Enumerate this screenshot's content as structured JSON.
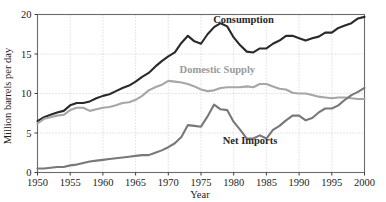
{
  "chart_data": {
    "type": "line",
    "title": "",
    "xlabel": "Year",
    "ylabel": "Million barrels per day",
    "xlim": [
      1950,
      2000
    ],
    "ylim": [
      0,
      20
    ],
    "xticks": [
      1950,
      1955,
      1960,
      1965,
      1970,
      1975,
      1980,
      1985,
      1990,
      1995,
      2000
    ],
    "xtick_labels": [
      "1950",
      "1955",
      "1960",
      "1965",
      "1970",
      "1975",
      "1980",
      "1985",
      "1990",
      "1995",
      "2000"
    ],
    "yticks": [
      0,
      5,
      10,
      15,
      20
    ],
    "ytick_labels": [
      "0",
      "5",
      "10",
      "15",
      "20"
    ],
    "grid": true,
    "legend_position": "inline-annotations",
    "x": [
      1950,
      1951,
      1952,
      1953,
      1954,
      1955,
      1956,
      1957,
      1958,
      1959,
      1960,
      1961,
      1962,
      1963,
      1964,
      1965,
      1966,
      1967,
      1968,
      1969,
      1970,
      1971,
      1972,
      1973,
      1974,
      1975,
      1976,
      1977,
      1978,
      1979,
      1980,
      1981,
      1982,
      1983,
      1984,
      1985,
      1986,
      1987,
      1988,
      1989,
      1990,
      1991,
      1992,
      1993,
      1994,
      1995,
      1996,
      1997,
      1998,
      1999,
      2000
    ],
    "series": [
      {
        "name": "Consumption",
        "color": "#2a2a2a",
        "label_x": 1981.5,
        "label_y": 18.9,
        "values": [
          6.5,
          7.0,
          7.3,
          7.6,
          7.8,
          8.5,
          8.8,
          8.8,
          9.0,
          9.4,
          9.7,
          9.9,
          10.3,
          10.7,
          11.0,
          11.5,
          12.1,
          12.6,
          13.4,
          14.1,
          14.7,
          15.2,
          16.4,
          17.3,
          16.6,
          16.3,
          17.5,
          18.4,
          18.9,
          18.5,
          17.1,
          16.1,
          15.3,
          15.2,
          15.7,
          15.7,
          16.3,
          16.7,
          17.3,
          17.3,
          17.0,
          16.7,
          17.0,
          17.2,
          17.7,
          17.7,
          18.3,
          18.6,
          18.9,
          19.5,
          19.7
        ]
      },
      {
        "name": "Domestic Supply",
        "color": "#a6a6a6",
        "label_x": 1977.5,
        "label_y": 12.6,
        "values": [
          6.2,
          6.8,
          7.0,
          7.2,
          7.3,
          7.9,
          8.2,
          8.2,
          7.8,
          8.0,
          8.2,
          8.3,
          8.5,
          8.8,
          8.9,
          9.2,
          9.7,
          10.4,
          10.8,
          11.1,
          11.6,
          11.5,
          11.4,
          11.2,
          10.9,
          10.5,
          10.3,
          10.4,
          10.7,
          10.8,
          10.8,
          10.8,
          10.9,
          10.8,
          11.2,
          11.2,
          10.9,
          10.6,
          10.5,
          10.1,
          10.0,
          10.0,
          9.8,
          9.6,
          9.5,
          9.4,
          9.5,
          9.5,
          9.4,
          9.3,
          9.3
        ]
      },
      {
        "name": "Net Imports",
        "color": "#787878",
        "label_x": 1982.5,
        "label_y": 3.6,
        "values": [
          0.5,
          0.5,
          0.6,
          0.7,
          0.7,
          0.9,
          1.0,
          1.2,
          1.4,
          1.5,
          1.6,
          1.7,
          1.8,
          1.9,
          2.0,
          2.1,
          2.2,
          2.2,
          2.5,
          2.8,
          3.2,
          3.7,
          4.5,
          6.0,
          5.9,
          5.8,
          7.1,
          8.6,
          8.0,
          7.9,
          6.4,
          5.4,
          4.3,
          4.3,
          4.7,
          4.3,
          5.4,
          5.9,
          6.6,
          7.2,
          7.2,
          6.6,
          6.9,
          7.6,
          8.1,
          8.1,
          8.5,
          9.2,
          9.8,
          10.2,
          10.7
        ]
      }
    ]
  }
}
